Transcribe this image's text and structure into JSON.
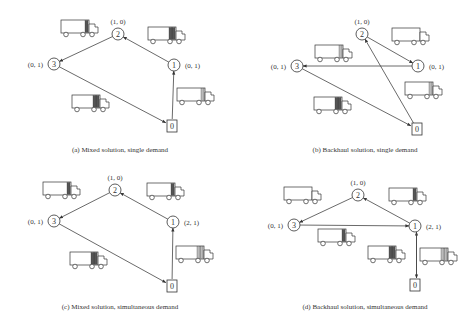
{
  "panels": [
    {
      "id": "a",
      "caption": "(a) Mixed solution, single demand",
      "nodes": [
        {
          "id": "0",
          "label": "0",
          "shape": "square",
          "x": 172,
          "y": 126
        },
        {
          "id": "1",
          "label": "1",
          "shape": "circle",
          "x": 174,
          "y": 65,
          "demand": "(0, 1)"
        },
        {
          "id": "2",
          "label": "2",
          "shape": "circle",
          "x": 118,
          "y": 34,
          "demand": "(1, 0)"
        },
        {
          "id": "3",
          "label": "3",
          "shape": "circle",
          "x": 54,
          "y": 64,
          "demand": "(0, 1)"
        }
      ],
      "edges": [
        [
          "0",
          "1"
        ],
        [
          "1",
          "2"
        ],
        [
          "2",
          "3"
        ],
        [
          "3",
          "0"
        ]
      ]
    },
    {
      "id": "b",
      "caption": "(b) Backhaul solution, single demand",
      "nodes": [
        {
          "id": "0",
          "label": "0",
          "shape": "square",
          "x": 417,
          "y": 129
        },
        {
          "id": "1",
          "label": "1",
          "shape": "circle",
          "x": 418,
          "y": 66,
          "demand": "(0, 1)"
        },
        {
          "id": "2",
          "label": "2",
          "shape": "circle",
          "x": 362,
          "y": 34,
          "demand": "(1, 0)"
        },
        {
          "id": "3",
          "label": "3",
          "shape": "circle",
          "x": 297,
          "y": 66,
          "demand": "(0, 1)"
        }
      ],
      "edges": [
        [
          "0",
          "2"
        ],
        [
          "2",
          "1"
        ],
        [
          "1",
          "3"
        ],
        [
          "3",
          "0"
        ]
      ]
    },
    {
      "id": "c",
      "caption": "(c) Mixed solution, simultaneous demand",
      "nodes": [
        {
          "id": "0",
          "label": "0",
          "shape": "square",
          "x": 172,
          "y": 286
        },
        {
          "id": "1",
          "label": "1",
          "shape": "circle",
          "x": 173,
          "y": 222,
          "demand": "(2, 1)"
        },
        {
          "id": "2",
          "label": "2",
          "shape": "circle",
          "x": 115,
          "y": 190,
          "demand": "(1, 0)"
        },
        {
          "id": "3",
          "label": "3",
          "shape": "circle",
          "x": 54,
          "y": 221,
          "demand": "(0, 1)"
        }
      ],
      "edges": [
        [
          "0",
          "1"
        ],
        [
          "1",
          "2"
        ],
        [
          "2",
          "3"
        ],
        [
          "3",
          "0"
        ]
      ]
    },
    {
      "id": "d",
      "caption": "(d) Backhaul solution, simultaneous demand",
      "nodes": [
        {
          "id": "0",
          "label": "0",
          "shape": "square",
          "x": 415,
          "y": 285
        },
        {
          "id": "1",
          "label": "1",
          "shape": "circle",
          "x": 415,
          "y": 226,
          "demand": "(2, 1)"
        },
        {
          "id": "2",
          "label": "2",
          "shape": "circle",
          "x": 358,
          "y": 195,
          "demand": "(1, 0)"
        },
        {
          "id": "3",
          "label": "3",
          "shape": "circle",
          "x": 294,
          "y": 225,
          "demand": "(0, 1)"
        }
      ],
      "edges": [
        [
          "0",
          "1"
        ],
        [
          "1",
          "0"
        ],
        [
          "1",
          "2"
        ],
        [
          "2",
          "3"
        ],
        [
          "3",
          "1"
        ]
      ]
    }
  ],
  "trucks": [
    {
      "panel": "a",
      "x": 61,
      "y": 20,
      "cargo": [
        "dark"
      ]
    },
    {
      "panel": "a",
      "x": 148,
      "y": 27,
      "cargo": [
        "dark",
        "dark"
      ]
    },
    {
      "panel": "a",
      "x": 72,
      "y": 95,
      "cargo": [
        "dark",
        "dark"
      ]
    },
    {
      "panel": "a",
      "x": 177,
      "y": 88,
      "cargo": [
        "light"
      ]
    },
    {
      "panel": "b",
      "x": 315,
      "y": 45,
      "cargo": [
        "light"
      ]
    },
    {
      "panel": "b",
      "x": 392,
      "y": 28,
      "cargo": []
    },
    {
      "panel": "b",
      "x": 314,
      "y": 97,
      "cargo": [
        "dark",
        "dark"
      ]
    },
    {
      "panel": "b",
      "x": 405,
      "y": 82,
      "cargo": [
        "light"
      ]
    },
    {
      "panel": "c",
      "x": 43,
      "y": 182,
      "cargo": [
        "dark"
      ]
    },
    {
      "panel": "c",
      "x": 147,
      "y": 183,
      "cargo": [
        "dark"
      ]
    },
    {
      "panel": "c",
      "x": 70,
      "y": 252,
      "cargo": [
        "dark",
        "dark"
      ]
    },
    {
      "panel": "c",
      "x": 176,
      "y": 246,
      "cargo": [
        "light",
        "light"
      ]
    },
    {
      "panel": "d",
      "x": 284,
      "y": 187,
      "cargo": []
    },
    {
      "panel": "d",
      "x": 389,
      "y": 188,
      "cargo": [
        "dark"
      ]
    },
    {
      "panel": "d",
      "x": 318,
      "y": 229,
      "cargo": [
        "dark"
      ]
    },
    {
      "panel": "d",
      "x": 368,
      "y": 246,
      "cargo": [
        "dark",
        "dark"
      ]
    },
    {
      "panel": "d",
      "x": 420,
      "y": 248,
      "cargo": [
        "light",
        "light"
      ]
    }
  ]
}
